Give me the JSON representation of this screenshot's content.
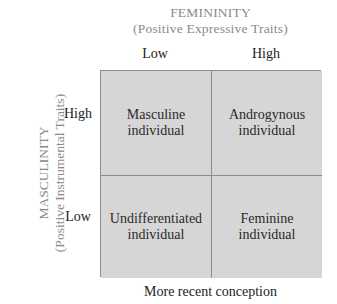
{
  "x_axis": {
    "title": "FEMININITY",
    "subtitle": "(Positive Expressive Traits)",
    "levels": [
      "Low",
      "High"
    ]
  },
  "y_axis": {
    "title": "MASCULINITY",
    "subtitle": "(Positive Instrumental Traits)",
    "levels": [
      "High",
      "Low"
    ]
  },
  "cells": {
    "high_low": {
      "line1": "Masculine",
      "line2": "individual"
    },
    "high_high": {
      "line1": "Androgynous",
      "line2": "individual"
    },
    "low_low": {
      "line1": "Undifferentiated",
      "line2": "individual"
    },
    "low_high": {
      "line1": "Feminine",
      "line2": "individual"
    }
  },
  "caption": "More recent conception",
  "colors": {
    "cell_fill": "#d6d6d6",
    "border": "#8c8c8c",
    "axis_title": "#8a8a8a"
  }
}
